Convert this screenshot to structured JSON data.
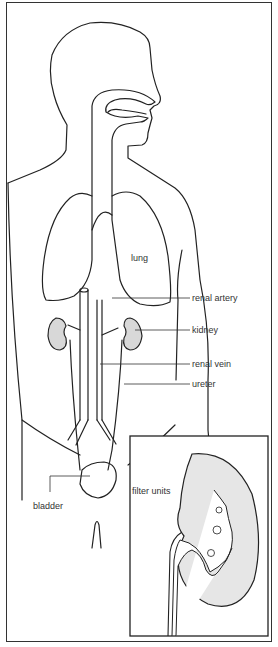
{
  "diagram": {
    "labels": {
      "lung": "lung",
      "renal_artery": "renal artery",
      "kidney": "kidney",
      "renal_vein": "renal vein",
      "ureter": "ureter",
      "bladder": "bladder",
      "filter_units": "filter units"
    },
    "colors": {
      "line": "#222222",
      "kidney_fill": "#d8d8d8",
      "background": "#ffffff"
    }
  }
}
